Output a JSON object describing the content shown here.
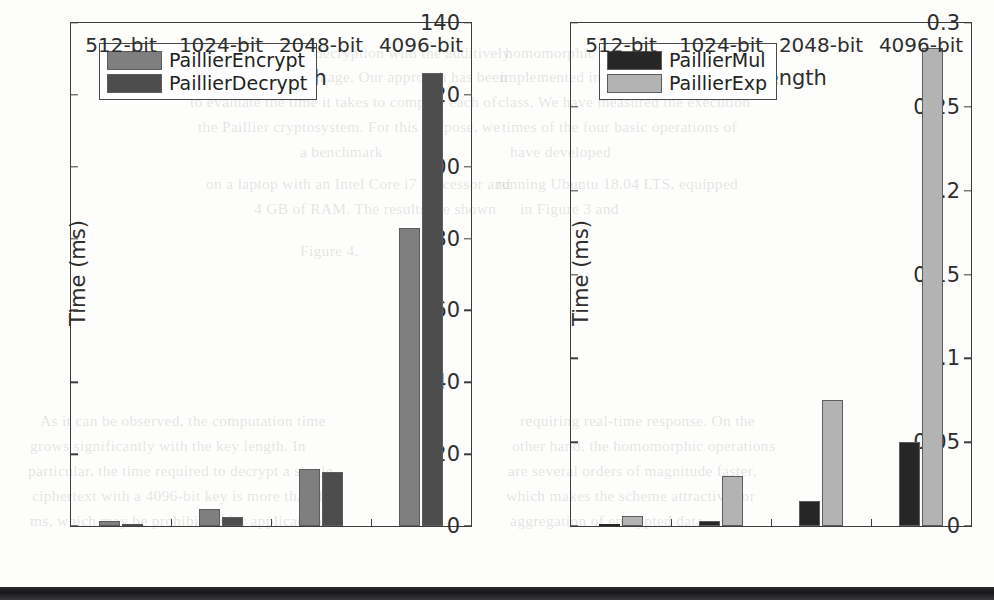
{
  "background_text": {
    "lines": [
      {
        "x": 190,
        "y": 44,
        "text": "the encryption and decryption with the additively"
      },
      {
        "x": 196,
        "y": 68,
        "text": "the information leakage. Our approach has been"
      },
      {
        "x": 190,
        "y": 93,
        "text": "to evaluate the time it takes to compute each of"
      },
      {
        "x": 198,
        "y": 118,
        "text": "the Paillier cryptosystem. For this purpose, we"
      },
      {
        "x": 300,
        "y": 143,
        "text": "a benchmark"
      },
      {
        "x": 206,
        "y": 175,
        "text": "on a laptop with an Intel Core i7 processor and"
      },
      {
        "x": 254,
        "y": 200,
        "text": "4 GB of RAM. The results are shown"
      },
      {
        "x": 300,
        "y": 242,
        "text": "Figure 4."
      },
      {
        "x": 40,
        "y": 412,
        "text": "As it can be observed, the computation time"
      },
      {
        "x": 30,
        "y": 437,
        "text": "grows significantly with the key length. In"
      },
      {
        "x": 28,
        "y": 462,
        "text": "particular, the time required to decrypt a single"
      },
      {
        "x": 32,
        "y": 487,
        "text": "ciphertext with a 4096-bit key is more than 120"
      },
      {
        "x": 30,
        "y": 512,
        "text": "ms, which may be prohibitive for applications"
      },
      {
        "x": 505,
        "y": 44,
        "text": "homomorphic encryption scheme and"
      },
      {
        "x": 500,
        "y": 68,
        "text": "implemented in Java using the BigInteger"
      },
      {
        "x": 498,
        "y": 93,
        "text": "class. We have measured the execution"
      },
      {
        "x": 502,
        "y": 118,
        "text": "times of the four basic operations of"
      },
      {
        "x": 510,
        "y": 143,
        "text": "have developed"
      },
      {
        "x": 496,
        "y": 175,
        "text": "running Ubuntu 18.04 LTS, equipped"
      },
      {
        "x": 520,
        "y": 200,
        "text": "in Figure 3 and"
      },
      {
        "x": 520,
        "y": 412,
        "text": "requiring real-time response. On the"
      },
      {
        "x": 512,
        "y": 437,
        "text": "other hand, the homomorphic operations"
      },
      {
        "x": 508,
        "y": 462,
        "text": "are several orders of magnitude faster,"
      },
      {
        "x": 506,
        "y": 487,
        "text": "which makes the scheme attractive for"
      },
      {
        "x": 510,
        "y": 512,
        "text": "aggregation of encrypted data"
      }
    ]
  },
  "colors": {
    "encrypt": "#7f7f7f",
    "decrypt": "#4d4d4d",
    "mul": "#262626",
    "exp": "#b3b3b3",
    "axis": "#3d3d3d",
    "text": "#2e2e2e"
  },
  "chart_data": [
    {
      "id": "paillier-enc-dec",
      "type": "bar",
      "title": "",
      "xlabel": "Key length",
      "ylabel": "Time (ms)",
      "categories": [
        "512-bit",
        "1024-bit",
        "2048-bit",
        "4096-bit"
      ],
      "ylim": [
        0,
        140
      ],
      "yticks": [
        0,
        20,
        40,
        60,
        80,
        100,
        120,
        140
      ],
      "ytick_labels": [
        "0",
        "20",
        "40",
        "60",
        "80",
        "100",
        "120",
        "140"
      ],
      "grid": false,
      "legend_position": "upper left",
      "series": [
        {
          "name": "PaillierEncrypt",
          "color": "#7f7f7f",
          "values": [
            1.4,
            4.6,
            16.0,
            83.0
          ]
        },
        {
          "name": "PaillierDecrypt",
          "color": "#4d4d4d",
          "values": [
            0.6,
            2.6,
            15.0,
            126.0
          ]
        }
      ]
    },
    {
      "id": "paillier-mul-exp",
      "type": "bar",
      "title": "",
      "xlabel": "Key length",
      "ylabel": "Time (ms)",
      "categories": [
        "512-bit",
        "1024-bit",
        "2048-bit",
        "4096-bit"
      ],
      "ylim": [
        0,
        0.3
      ],
      "yticks": [
        0,
        0.05,
        0.1,
        0.15,
        0.2,
        0.25,
        0.3
      ],
      "ytick_labels": [
        "0",
        "0.05",
        "0.1",
        "0.15",
        "0.2",
        "0.25",
        "0.3"
      ],
      "grid": false,
      "legend_position": "upper left",
      "series": [
        {
          "name": "PaillierMul",
          "color": "#262626",
          "values": [
            0.001,
            0.003,
            0.015,
            0.05
          ]
        },
        {
          "name": "PaillierExp",
          "color": "#b3b3b3",
          "values": [
            0.006,
            0.03,
            0.075,
            0.285
          ]
        }
      ]
    }
  ]
}
